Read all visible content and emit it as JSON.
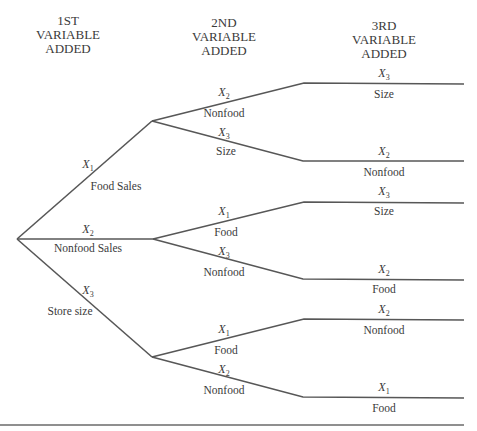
{
  "headers": [
    {
      "lines": [
        "1ST",
        "VARIABLE",
        "ADDED"
      ]
    },
    {
      "lines": [
        "2ND",
        "VARIABLE",
        "ADDED"
      ]
    },
    {
      "lines": [
        "3RD",
        "VARIABLE",
        "ADDED"
      ]
    }
  ],
  "level1": [
    {
      "var": "X",
      "sub": "1",
      "label": "Food Sales"
    },
    {
      "var": "X",
      "sub": "2",
      "label": "Nonfood Sales"
    },
    {
      "var": "X",
      "sub": "3",
      "label": "Store size"
    }
  ],
  "level2": [
    {
      "var": "X",
      "sub": "2",
      "label": "Nonfood"
    },
    {
      "var": "X",
      "sub": "3",
      "label": "Size"
    },
    {
      "var": "X",
      "sub": "1",
      "label": "Food"
    },
    {
      "var": "X",
      "sub": "3",
      "label": "Nonfood"
    },
    {
      "var": "X",
      "sub": "1",
      "label": "Food"
    },
    {
      "var": "X",
      "sub": "2",
      "label": "Nonfood"
    }
  ],
  "level3": [
    {
      "var": "X",
      "sub": "3",
      "label": "Size"
    },
    {
      "var": "X",
      "sub": "2",
      "label": "Nonfood"
    },
    {
      "var": "X",
      "sub": "3",
      "label": "Size"
    },
    {
      "var": "X",
      "sub": "2",
      "label": "Food"
    },
    {
      "var": "X",
      "sub": "2",
      "label": "Nonfood"
    },
    {
      "var": "X",
      "sub": "1",
      "label": "Food"
    }
  ],
  "colors": {
    "line": "#575757",
    "text": "#3a3a3a",
    "background": "#ffffff"
  }
}
